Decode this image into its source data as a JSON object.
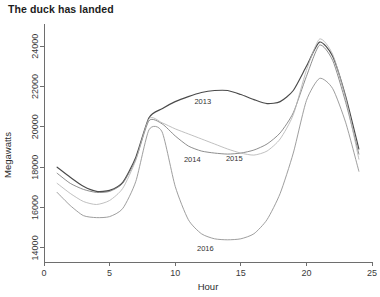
{
  "chart_data": {
    "type": "line",
    "title": "The duck has landed",
    "xlabel": "Hour",
    "ylabel": "Megawatts",
    "xlim": [
      0,
      25
    ],
    "ylim": [
      13300,
      24900
    ],
    "grid": false,
    "legend": "inline-labels",
    "xticks": [
      0,
      5,
      10,
      15,
      20,
      25
    ],
    "xtick_labels": [
      "0",
      "5",
      "10",
      "15",
      "20",
      "25"
    ],
    "yticks": [
      14000,
      16000,
      18000,
      20000,
      22000,
      24000
    ],
    "ytick_labels": [
      "14000",
      "16000",
      "18000",
      "20000",
      "22000",
      "24000"
    ],
    "x": [
      1,
      2,
      3,
      4,
      5,
      6,
      7,
      8,
      9,
      10,
      11,
      12,
      13,
      14,
      15,
      16,
      17,
      18,
      19,
      20,
      21,
      22,
      23,
      24
    ],
    "series": [
      {
        "name": "2013",
        "label": "2013",
        "color": "#4a4a4a",
        "label_x": 12.1,
        "label_y": 21150,
        "values": [
          18000,
          17500,
          17050,
          16800,
          16850,
          17250,
          18500,
          20450,
          20900,
          21250,
          21500,
          21700,
          21800,
          21800,
          21600,
          21350,
          21150,
          21250,
          21800,
          23000,
          24200,
          23500,
          21500,
          18900
        ]
      },
      {
        "name": "2014",
        "label": "2014",
        "color": "#7a7a7a",
        "label_x": 11.3,
        "label_y": 18250,
        "values": [
          17700,
          17200,
          16900,
          16750,
          16800,
          17200,
          18400,
          20300,
          20150,
          19550,
          19050,
          18800,
          18700,
          18650,
          18700,
          18850,
          19150,
          19700,
          20700,
          22500,
          24050,
          23300,
          21200,
          18650
        ]
      },
      {
        "name": "2015",
        "label": "2015",
        "color": "#b5b5b5",
        "label_x": 14.5,
        "label_y": 18300,
        "values": [
          17200,
          16700,
          16300,
          16150,
          16350,
          16950,
          18350,
          20400,
          20200,
          19900,
          19650,
          19400,
          19150,
          18900,
          18700,
          18600,
          18800,
          19400,
          20600,
          22800,
          24350,
          23600,
          21400,
          18400
        ]
      },
      {
        "name": "2016",
        "label": "2016",
        "color": "#8c8c8c",
        "label_x": 12.3,
        "label_y": 13850,
        "values": [
          16750,
          16100,
          15600,
          15500,
          15550,
          15950,
          17300,
          19850,
          19750,
          17050,
          15400,
          14700,
          14450,
          14400,
          14450,
          14700,
          15400,
          16700,
          18700,
          21300,
          22400,
          21900,
          20200,
          17800
        ]
      }
    ]
  },
  "plot_geometry": {
    "left": 44,
    "right": 372,
    "top": 28,
    "bottom": 262
  }
}
